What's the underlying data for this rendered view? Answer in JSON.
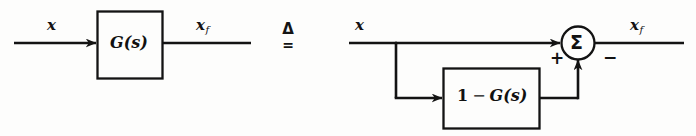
{
  "figure": {
    "background_color": "#fdfdfc",
    "ink_color": "#131313"
  },
  "left_diagram": {
    "input_label": {
      "base": "x",
      "sub": ""
    },
    "block": {
      "text_leading": "",
      "operator": "",
      "text_trailing": "G(s)",
      "full": "G(s)"
    },
    "output_label": {
      "base": "x",
      "sub": "f"
    }
  },
  "equivalence": {
    "delta_symbol": "Δ",
    "equals_symbol": "=",
    "meaning": "is defined as"
  },
  "right_diagram": {
    "input_label": {
      "base": "x",
      "sub": ""
    },
    "block": {
      "text_leading": "1",
      "operator": "−",
      "text_trailing": "G(s)",
      "full": "1 − G(s)"
    },
    "summing_junction": {
      "symbol": "Σ",
      "plus_sign": "+",
      "minus_sign": "−"
    },
    "output_label": {
      "base": "x",
      "sub": "f"
    }
  }
}
